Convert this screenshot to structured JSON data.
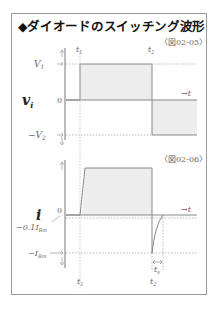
{
  "title": "◆ダイオードのスイッチング波形",
  "figures": [
    {
      "ref": "〈図02-05〉",
      "y_label": "v",
      "y_label_sub": "i",
      "levels": {
        "top": "V",
        "top_sub": "1",
        "zero": "0",
        "bottom": "−V",
        "bottom_sub": "2"
      },
      "time_arrow": "→t",
      "t_markers": [
        {
          "label": "t",
          "sub": "1"
        },
        {
          "label": "t",
          "sub": "2"
        }
      ]
    },
    {
      "ref": "〈図02-06〉",
      "y_label": "i",
      "levels": {
        "zero": "0",
        "near_zero": "−0.1I",
        "near_zero_sub": "Rm",
        "bottom": "−I",
        "bottom_sub": "Rm"
      },
      "time_arrow": "→t",
      "t_markers": [
        {
          "label": "t",
          "sub": "1"
        },
        {
          "label": "t",
          "sub": "2"
        }
      ],
      "ts_label": "t",
      "ts_sub": "s"
    }
  ],
  "colors": {
    "fill": "#ededed",
    "line": "#888888",
    "text": "#666666",
    "title": "#111111"
  }
}
